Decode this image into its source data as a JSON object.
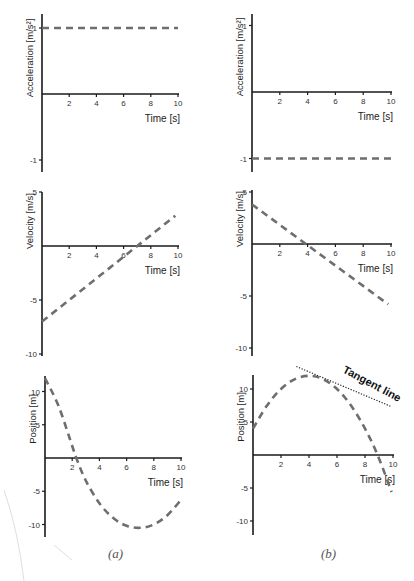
{
  "panel_labels": [
    "(a)",
    "(b)"
  ],
  "tangent_label": "Tangent line",
  "chart_data": [
    {
      "type": "line",
      "panel": "(a)",
      "row": "acceleration",
      "xlabel": "Time [s]",
      "ylabel": "Acceleration [m/s²]",
      "xticks": [
        2,
        4,
        6,
        8,
        10
      ],
      "yticks": [
        1,
        -1
      ],
      "xlim": [
        0,
        10
      ],
      "ylim": [
        -1.2,
        1.2
      ],
      "line_style": "dashed",
      "series": [
        {
          "name": "a(t)",
          "x": [
            0,
            10
          ],
          "y": [
            1,
            1
          ]
        }
      ]
    },
    {
      "type": "line",
      "panel": "(b)",
      "row": "acceleration",
      "xlabel": "Time [s]",
      "ylabel": "Acceleration [m/s²]",
      "xticks": [
        2,
        4,
        6,
        8,
        10
      ],
      "yticks": [
        1,
        -1
      ],
      "xlim": [
        0,
        10
      ],
      "ylim": [
        -1.2,
        1.2
      ],
      "line_style": "dashed",
      "series": [
        {
          "name": "a(t)",
          "x": [
            0,
            10
          ],
          "y": [
            -1,
            -1
          ]
        }
      ]
    },
    {
      "type": "line",
      "panel": "(a)",
      "row": "velocity",
      "xlabel": "Time [s]",
      "ylabel": "Velocity [m/s]",
      "xticks": [
        2,
        4,
        6,
        8,
        10
      ],
      "yticks": [
        5,
        -5,
        -10
      ],
      "xlim": [
        0,
        10
      ],
      "ylim": [
        -10,
        5
      ],
      "line_style": "dashed",
      "series": [
        {
          "name": "v(t)",
          "x": [
            0,
            9.8
          ],
          "y": [
            -7,
            2.8
          ]
        }
      ]
    },
    {
      "type": "line",
      "panel": "(b)",
      "row": "velocity",
      "xlabel": "Time [s]",
      "ylabel": "Velocity [m/s]",
      "xticks": [
        2,
        4,
        6,
        8,
        10
      ],
      "yticks": [
        5,
        -5,
        -10
      ],
      "xlim": [
        0,
        10
      ],
      "ylim": [
        -10,
        5
      ],
      "line_style": "dashed",
      "series": [
        {
          "name": "v(t)",
          "x": [
            0,
            9.8
          ],
          "y": [
            3.8,
            -5.8
          ]
        }
      ]
    },
    {
      "type": "line",
      "panel": "(a)",
      "row": "position",
      "xlabel": "Time [s]",
      "ylabel": "Position [m]",
      "xticks": [
        2,
        4,
        6,
        8,
        10
      ],
      "yticks": [
        10,
        5,
        -5,
        -10
      ],
      "xlim": [
        0,
        10
      ],
      "ylim": [
        -12,
        12
      ],
      "line_style": "dashed",
      "series": [
        {
          "name": "x(t)",
          "x": [
            0,
            1,
            2,
            2.3,
            3,
            4,
            5,
            6,
            7,
            8,
            9,
            10
          ],
          "y": [
            12,
            7.8,
            1.8,
            0,
            -3.4,
            -6.8,
            -9.0,
            -10.2,
            -10.5,
            -10.0,
            -8.6,
            -6.3
          ]
        }
      ]
    },
    {
      "type": "line",
      "panel": "(b)",
      "row": "position",
      "xlabel": "Time [s]",
      "ylabel": "Position [m]",
      "xticks": [
        2,
        4,
        6,
        8,
        10
      ],
      "yticks": [
        10,
        5,
        -5,
        -10
      ],
      "xlim": [
        0,
        10
      ],
      "ylim": [
        -12,
        12
      ],
      "line_style": "dashed",
      "series": [
        {
          "name": "x(t)",
          "x": [
            0,
            1,
            2,
            3,
            4,
            5,
            6,
            7,
            8,
            8.9,
            9.9
          ],
          "y": [
            4,
            7.5,
            10.0,
            11.5,
            12.0,
            11.5,
            10.0,
            7.5,
            4.0,
            0,
            -5.6
          ]
        }
      ],
      "annotations": [
        {
          "text": "Tangent line",
          "type": "tangent",
          "at_x": 5,
          "from": [
            3.1,
            12.5
          ],
          "to": [
            10,
            6.9
          ]
        }
      ]
    }
  ]
}
